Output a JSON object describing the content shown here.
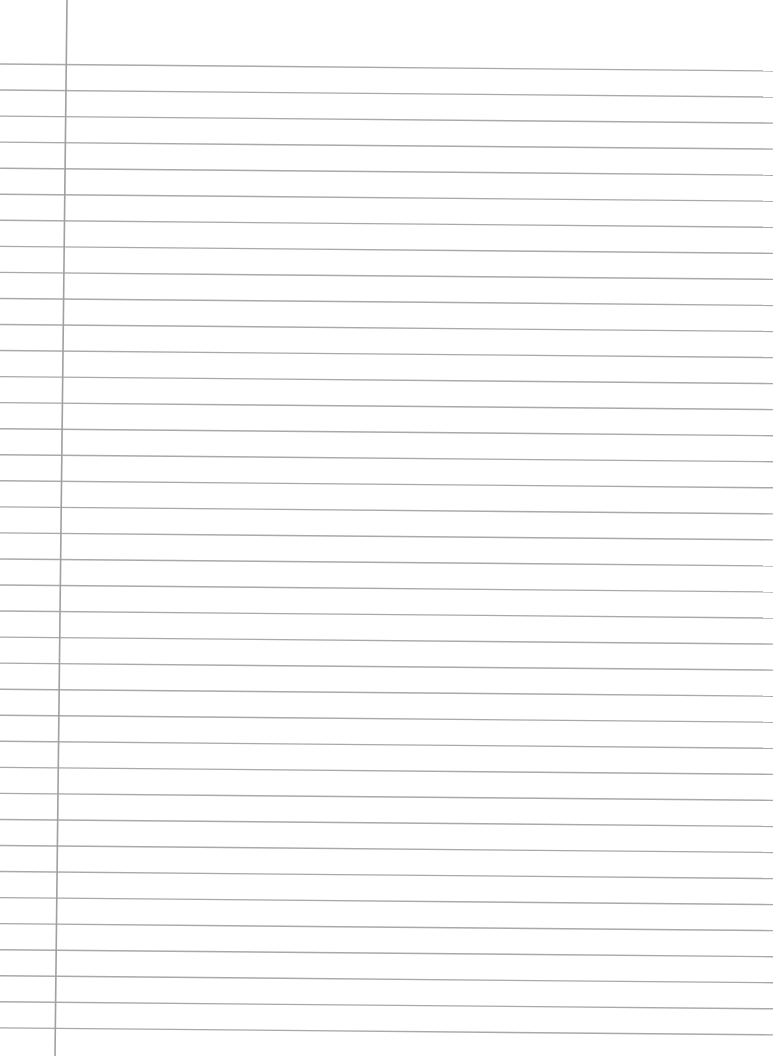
{
  "page": {
    "type": "ruled-notebook-paper",
    "background": "#ffffff",
    "line_color": "#a9a9a9",
    "margin_line_color": "#a0a0a0",
    "line_count": 38,
    "first_line_left_y": 64,
    "first_line_right_y": 71,
    "line_spacing": 26.05,
    "line_x_end": 773,
    "margin_line": {
      "top_x": 67,
      "top_y": 0,
      "bottom_x": 55,
      "bottom_y": 1056
    }
  }
}
